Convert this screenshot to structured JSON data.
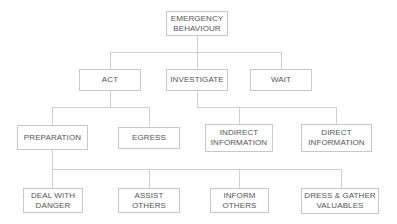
{
  "diagram": {
    "type": "tree",
    "root": {
      "id": "emergency",
      "label": "EMERGENCY\nBEHAVIOUR"
    },
    "level1": [
      {
        "id": "act",
        "label": "ACT"
      },
      {
        "id": "investigate",
        "label": "INVESTIGATE"
      },
      {
        "id": "wait",
        "label": "WAIT"
      }
    ],
    "level2": [
      {
        "id": "preparation",
        "label": "PREPARATION",
        "parent": "act"
      },
      {
        "id": "egress",
        "label": "EGRESS",
        "parent": "act"
      },
      {
        "id": "indirect",
        "label": "INDIRECT\nINFORMATION",
        "parent": "investigate"
      },
      {
        "id": "direct",
        "label": "DIRECT\nINFORMATION",
        "parent": "investigate"
      }
    ],
    "level3": [
      {
        "id": "deal",
        "label": "DEAL WITH\nDANGER",
        "parent": "preparation"
      },
      {
        "id": "assist",
        "label": "ASSIST\nOTHERS",
        "parent": "preparation"
      },
      {
        "id": "inform",
        "label": "INFORM\nOTHERS",
        "parent": "preparation"
      },
      {
        "id": "dress",
        "label": "DRESS & GATHER\nVALUABLES",
        "parent": "preparation"
      }
    ],
    "colors": {
      "line": "#cfcfcf",
      "border": "#c8c8c8",
      "text": "#555555",
      "background": "#ffffff"
    }
  }
}
